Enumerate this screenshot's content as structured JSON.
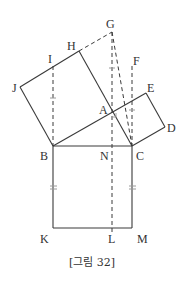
{
  "caption": "[그림 32]",
  "colors": {
    "line": "#3a3a3a",
    "tick": "#9a9a9a",
    "label": "#333333"
  },
  "points": {
    "G": {
      "x": 112,
      "y": 32
    },
    "H": {
      "x": 79,
      "y": 51
    },
    "I": {
      "x": 53,
      "y": 66
    },
    "J": {
      "x": 20,
      "y": 87
    },
    "F": {
      "x": 132,
      "y": 66
    },
    "E": {
      "x": 146,
      "y": 93
    },
    "A": {
      "x": 112,
      "y": 112
    },
    "D": {
      "x": 165,
      "y": 127
    },
    "B": {
      "x": 53,
      "y": 146
    },
    "N": {
      "x": 112,
      "y": 146
    },
    "C": {
      "x": 132,
      "y": 146
    },
    "K": {
      "x": 53,
      "y": 228
    },
    "L": {
      "x": 112,
      "y": 228
    },
    "M": {
      "x": 132,
      "y": 228
    }
  },
  "labels": {
    "G": "G",
    "H": "H",
    "I": "I",
    "J": "J",
    "F": "F",
    "E": "E",
    "A": "A",
    "D": "D",
    "B": "B",
    "N": "N",
    "C": "C",
    "K": "K",
    "L": "L",
    "M": "M"
  },
  "solid_segments": [
    [
      "J",
      "H"
    ],
    [
      "J",
      "B"
    ],
    [
      "H",
      "C"
    ],
    [
      "B",
      "E"
    ],
    [
      "E",
      "D"
    ],
    [
      "D",
      "C"
    ],
    [
      "B",
      "C"
    ],
    [
      "B",
      "K"
    ],
    [
      "K",
      "M"
    ],
    [
      "C",
      "M"
    ]
  ],
  "dashed_segments": [
    [
      "H",
      "G"
    ],
    [
      "G",
      "C"
    ],
    [
      "G",
      "L"
    ],
    [
      "I",
      "B"
    ],
    [
      "F",
      "C"
    ]
  ],
  "marks": {
    "equal_single": [
      "IB",
      "GA",
      "FC"
    ],
    "equal_double": [
      "BK",
      "CM"
    ],
    "right_angle": "A"
  }
}
